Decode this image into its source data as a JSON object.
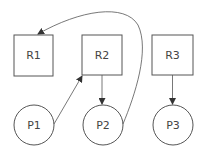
{
  "diagram": {
    "resources": [
      {
        "id": "R1",
        "label": "R1"
      },
      {
        "id": "R2",
        "label": "R2"
      },
      {
        "id": "R3",
        "label": "R3"
      }
    ],
    "processes": [
      {
        "id": "P1",
        "label": "P1"
      },
      {
        "id": "P2",
        "label": "P2"
      },
      {
        "id": "P3",
        "label": "P3"
      }
    ],
    "edges": [
      {
        "from": "P1",
        "to": "R2"
      },
      {
        "from": "R2",
        "to": "P2"
      },
      {
        "from": "P2",
        "to": "R1"
      },
      {
        "from": "R3",
        "to": "P3"
      }
    ],
    "stroke_color": "#555555"
  }
}
